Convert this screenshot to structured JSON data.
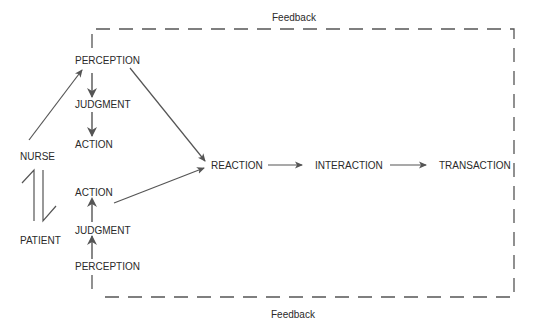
{
  "feedback": {
    "top_label": "Feedback",
    "bottom_label": "Feedback"
  },
  "nurse": {
    "label": "NURSE",
    "perception": "PERCEPTION",
    "judgment": "JUDGMENT",
    "action": "ACTION"
  },
  "patient": {
    "label": "PATIENT",
    "perception": "PERCEPTION",
    "judgment": "JUDGMENT",
    "action": "ACTION"
  },
  "flow": {
    "reaction": "REACTION",
    "interaction": "INTERACTION",
    "transaction": "TRANSACTION"
  },
  "colors": {
    "line": "#555555",
    "text": "#2a2a2a"
  }
}
